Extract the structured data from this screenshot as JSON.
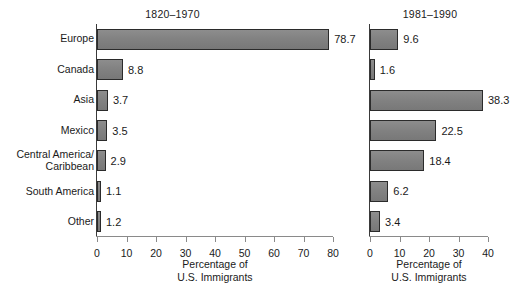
{
  "chart_data": {
    "type": "bar",
    "orientation": "horizontal",
    "title": "",
    "categories": [
      "Europe",
      "Canada",
      "Asia",
      "Mexico",
      "Central America/\nCaribbean",
      "South America",
      "Other"
    ],
    "panels": [
      {
        "title": "1820–1970",
        "values": [
          78.7,
          8.8,
          3.7,
          3.5,
          2.9,
          1.1,
          1.2
        ],
        "value_labels": [
          "78.7",
          "8.8",
          "3.7",
          "3.5",
          "2.9",
          "1.1",
          "1.2"
        ],
        "xlabel": "Percentage of\nU.S. Immigrants",
        "ylabel": "",
        "xlim": [
          0,
          80
        ],
        "xticks": [
          0,
          10,
          20,
          30,
          40,
          50,
          60,
          70,
          80
        ],
        "xtick_labels": [
          "0",
          "10",
          "20",
          "30",
          "40",
          "50",
          "60",
          "70",
          "80"
        ],
        "grid": false
      },
      {
        "title": "1981–1990",
        "values": [
          9.6,
          1.6,
          38.3,
          22.5,
          18.4,
          6.2,
          3.4
        ],
        "value_labels": [
          "9.6",
          "1.6",
          "38.3",
          "22.5",
          "18.4",
          "6.2",
          "3.4"
        ],
        "xlabel": "Percentage of\nU.S. Immigrants",
        "ylabel": "",
        "xlim": [
          0,
          40
        ],
        "xticks": [
          0,
          10,
          20,
          30,
          40
        ],
        "xtick_labels": [
          "0",
          "10",
          "20",
          "30",
          "40"
        ],
        "grid": false
      }
    ],
    "legend": [],
    "legend_position": "none",
    "colors": {
      "bar_fill": "#828282",
      "bar_border": "#2b2b2b",
      "axis": "#8a8a8a",
      "text": "#1a1a1a",
      "background": "#ffffff"
    }
  }
}
